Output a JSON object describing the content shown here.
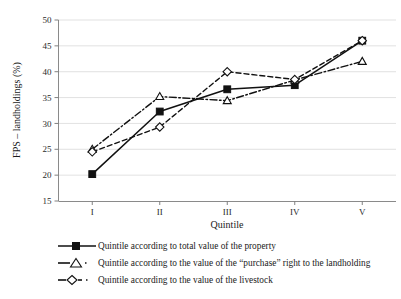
{
  "chart_data": {
    "type": "line",
    "title": "",
    "xlabel": "Quintile",
    "ylabel": "FPS – landholdings (%)",
    "categories": [
      "I",
      "II",
      "III",
      "IV",
      "V"
    ],
    "ylim": [
      15,
      50
    ],
    "yticks": [
      15,
      20,
      25,
      30,
      35,
      40,
      45,
      50
    ],
    "ytick_labels": [
      "15",
      "20",
      "25",
      "30",
      "35",
      "40",
      "45",
      "50"
    ],
    "grid": "horizontal",
    "legend_position": "bottom-left",
    "series": [
      {
        "name": "Quintile according to total value of the property",
        "marker": "filled-square",
        "line_style": "solid",
        "values": [
          20.2,
          32.3,
          36.6,
          37.4,
          46.0
        ]
      },
      {
        "name": "Quintile according to the value of the “purchase” right to the landholding",
        "marker": "open-triangle",
        "line_style": "dash-dot",
        "values": [
          25.0,
          35.2,
          34.4,
          38.4,
          42.0
        ]
      },
      {
        "name": "Quintile according to the value of the livestock",
        "marker": "open-diamond",
        "line_style": "dashed",
        "values": [
          24.5,
          29.3,
          40.0,
          38.5,
          46.0
        ]
      }
    ]
  },
  "colors": {
    "line": "#111111",
    "grid": "#d9d9d9",
    "axis": "#808080",
    "text": "#1a1a1a",
    "background": "#ffffff"
  },
  "legend": {
    "items": [
      {
        "label": "Quintile according to total value of the property"
      },
      {
        "label": "Quintile according to the value of the “purchase” right to the landholding"
      },
      {
        "label": "Quintile according to the value of the livestock"
      }
    ]
  }
}
